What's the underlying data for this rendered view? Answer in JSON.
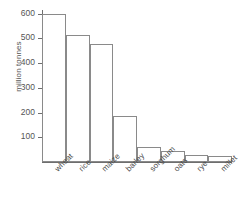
{
  "chart_data": {
    "type": "bar",
    "title": "",
    "subtitle": "",
    "xlabel": "",
    "ylabel": "million tonnes",
    "categories": [
      "wheat",
      "rice",
      "maize",
      "barley",
      "sorghum",
      "oats",
      "rye",
      "millet"
    ],
    "values": [
      600,
      515,
      475,
      185,
      60,
      43,
      30,
      25
    ],
    "ylim": [
      0,
      620
    ],
    "yticks": [
      100,
      200,
      300,
      400,
      500,
      600
    ],
    "ytick_labels": [
      "100",
      "200",
      "300",
      "400",
      "500",
      "600"
    ],
    "grid": false,
    "legend": null,
    "legend_position": "none",
    "bar_style": {
      "fill": "#ffffff",
      "edge": "#8a8a8a",
      "gap": 0
    },
    "axis_color": "#6e6e6e",
    "text_color": "#4a4a4a"
  }
}
